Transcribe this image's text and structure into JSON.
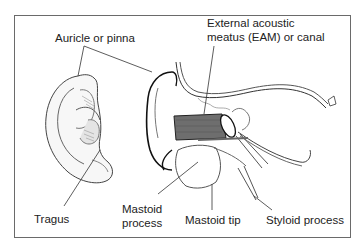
{
  "figure": {
    "labels": {
      "auricle": "Auricle or pinna",
      "eam_line1": "External acoustic",
      "eam_line2": "meatus (EAM) or canal",
      "tragus": "Tragus",
      "mastoid_process_line1": "Mastoid",
      "mastoid_process_line2": "process",
      "mastoid_tip": "Mastoid tip",
      "styloid_process": "Styloid process"
    },
    "colors": {
      "frame": "#6a6a6a",
      "line": "#333333",
      "canal_fill": "#6e6e6e"
    }
  }
}
